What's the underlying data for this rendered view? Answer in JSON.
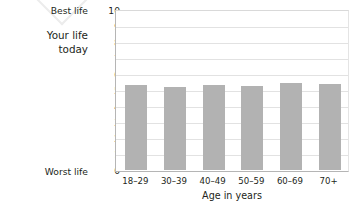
{
  "chart_data": {
    "type": "bar",
    "title": "",
    "categories": [
      "18–29",
      "30–39",
      "40–49",
      "50–59",
      "60–69",
      "70+"
    ],
    "values": [
      5.3,
      5.2,
      5.3,
      5.25,
      5.45,
      5.35
    ],
    "series": [
      {
        "name": "Your life today",
        "values": [
          5.3,
          5.2,
          5.3,
          5.25,
          5.45,
          5.35
        ]
      }
    ],
    "xlabel": "Age in years",
    "ylabel": "Your life today",
    "ylim": [
      0,
      10
    ],
    "ytick_labels": [
      "0",
      "1",
      "2",
      "3",
      "4",
      "5",
      "6",
      "7",
      "8",
      "9",
      "10"
    ],
    "ytick_values": [
      0,
      1,
      2,
      3,
      4,
      5,
      6,
      7,
      8,
      9,
      10
    ],
    "axis_endpoint_labels": {
      "top": "Best life",
      "bottom": "Worst life"
    },
    "grid": true,
    "legend": "none",
    "bar_color": "#b2b2b2",
    "gridline_color": "#e2e2e2",
    "axis_color": "#b5b5b5",
    "text_color": "#231f20"
  },
  "series_label": {
    "line1": "Your life",
    "line2": "today"
  }
}
